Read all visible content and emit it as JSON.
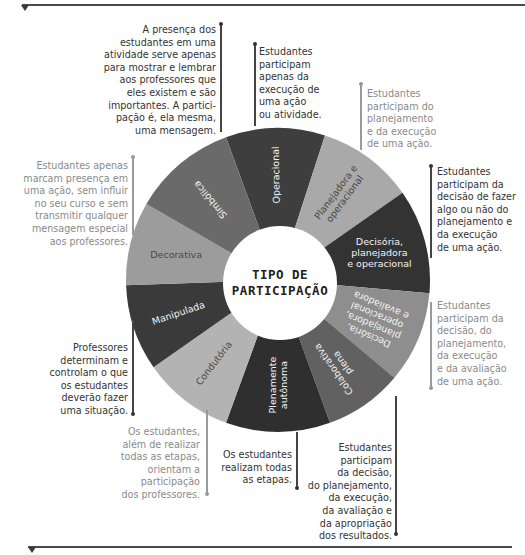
{
  "title": {
    "line1": "TIPO DE",
    "line2": "PARTICIPAÇÃO"
  },
  "segments": [
    {
      "id": "operacional",
      "label_lines": [
        "Operacional"
      ],
      "start_deg": -20,
      "end_deg": 18,
      "color": "#3e3e3e"
    },
    {
      "id": "planejadora-operacional",
      "label_lines": [
        "Planejadora e",
        "operacional"
      ],
      "start_deg": 18,
      "end_deg": 55,
      "color": "#a9a9a9"
    },
    {
      "id": "decisoria-planejadora-operacional",
      "label_lines": [
        "Decisória,",
        "planejadora",
        "e operacional"
      ],
      "start_deg": 55,
      "end_deg": 95,
      "color": "#333333"
    },
    {
      "id": "decisoria-planejadora-operacional-avaliadora",
      "label_lines": [
        "Decisória,",
        "planejadora,",
        "operacional",
        "e avaliadora"
      ],
      "start_deg": 95,
      "end_deg": 130,
      "color": "#8e8e8e"
    },
    {
      "id": "colaborativa-plena",
      "label_lines": [
        "Colaborativa",
        "plena"
      ],
      "start_deg": 130,
      "end_deg": 160,
      "color": "#616161"
    },
    {
      "id": "plenamente-autonoma",
      "label_lines": [
        "Plenamente",
        "autônoma"
      ],
      "start_deg": 160,
      "end_deg": 200,
      "color": "#2f2f2f"
    },
    {
      "id": "condutoria",
      "label_lines": [
        "Condutória"
      ],
      "start_deg": 200,
      "end_deg": 235,
      "color": "#b3b3b3"
    },
    {
      "id": "manipulada",
      "label_lines": [
        "Manipulada"
      ],
      "start_deg": 235,
      "end_deg": 268,
      "color": "#3a3a3a"
    },
    {
      "id": "decorativa",
      "label_lines": [
        "Decorativa"
      ],
      "start_deg": 268,
      "end_deg": 300,
      "color": "#9c9c9c"
    },
    {
      "id": "simbolica",
      "label_lines": [
        "Simbólica"
      ],
      "start_deg": 300,
      "end_deg": 340,
      "color": "#6a6a6a"
    }
  ],
  "notes": {
    "simbolica": "A presença dos\nestudantes em uma\natividade serve apenas\npara mostrar e lembrar\naos professores que\neles existem e são\nimportantes. A partici-\npação é, ela mesma,\numa mensagem.",
    "operacional": "Estudantes\nparticipam\napenas da\nexecução de\numa ação\nou atividade.",
    "planejadora_operacional": "Estudantes\nparticipam do\nplanejamento\ne da execução\nde uma ação.",
    "decisoria_planejadora_operacional": "Estudantes\nparticipam da\ndecisão de fazer\nalgo ou não do\nplanejamento e\nda execução\nde uma ação.",
    "decorativa": "Estudantes apenas\nmarcam presença em\numa ação, sem influir\nno seu curso e sem\ntransmitir qualquer\nmensagem especial\naos professores.",
    "decisoria_planejadora_operacional_avaliadora": "Estudantes\nparticipam da\ndecisão, do\nplanejamento,\nda execução\ne da avaliação\nde uma ação.",
    "manipulada": "Professores\ndeterminam e\ncontrolam o que\nos estudantes\ndeverão fazer\numa situação.",
    "condutoria": "Os estudantes,\nalém de realizar\ntodas as etapas,\norientam a\nparticipação\ndos professores.",
    "plenamente_autonoma": "Os estudantes\nrealizam todas\nas etapas.",
    "colaborativa_plena": "Estudantes\nparticipam\nda decisão,\ndo planejamento,\nda execução,\nda avaliação e\nda apropriação\ndos resultados."
  },
  "wheel": {
    "cx": 278,
    "cy": 280,
    "outer_r": 152,
    "inner_r": 57
  }
}
